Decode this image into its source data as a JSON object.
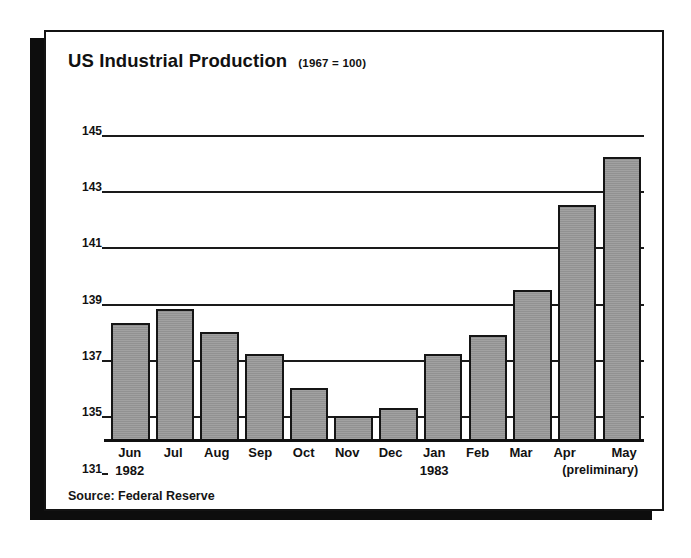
{
  "figure": {
    "title": "US Industrial Production",
    "subtitle": "(1967 = 100)",
    "source": "Source: Federal Reserve"
  },
  "chart_data": {
    "type": "bar",
    "title": "US Industrial Production",
    "subtitle": "(1967 = 100)",
    "xlabel": "",
    "ylabel": "",
    "ylim": [
      131,
      145
    ],
    "grid": true,
    "legend": "none",
    "source": "Source: Federal Reserve",
    "ytick_labels": [
      "145",
      "143",
      "141",
      "139",
      "137",
      "135",
      "131"
    ],
    "ytick_values": [
      145,
      143,
      141,
      139,
      137,
      135,
      131
    ],
    "axis_note": "baseline is broken/compressed between 135 and 131",
    "categories": [
      "Jun",
      "Jul",
      "Aug",
      "Sep",
      "Oct",
      "Nov",
      "Dec",
      "Jan",
      "Feb",
      "Mar",
      "Apr",
      "May"
    ],
    "category_years": [
      "1982",
      "",
      "",
      "",
      "",
      "",
      "",
      "1983",
      "",
      "",
      "",
      ""
    ],
    "category_notes": [
      "",
      "",
      "",
      "",
      "",
      "",
      "",
      "",
      "",
      "",
      "",
      "(preliminary)"
    ],
    "values": [
      138.3,
      138.8,
      138.0,
      137.2,
      136.0,
      135.0,
      135.3,
      137.2,
      137.9,
      139.5,
      142.5,
      144.2
    ]
  },
  "bars": [
    {
      "label": "Jun",
      "year": "1982",
      "note": "",
      "value": 138.3
    },
    {
      "label": "Jul",
      "year": "",
      "note": "",
      "value": 138.8
    },
    {
      "label": "Aug",
      "year": "",
      "note": "",
      "value": 138.0
    },
    {
      "label": "Sep",
      "year": "",
      "note": "",
      "value": 137.2
    },
    {
      "label": "Oct",
      "year": "",
      "note": "",
      "value": 136.0
    },
    {
      "label": "Nov",
      "year": "",
      "note": "",
      "value": 135.0
    },
    {
      "label": "Dec",
      "year": "",
      "note": "",
      "value": 135.3
    },
    {
      "label": "Jan",
      "year": "1983",
      "note": "",
      "value": 137.2
    },
    {
      "label": "Feb",
      "year": "",
      "note": "",
      "value": 137.9
    },
    {
      "label": "Mar",
      "year": "",
      "note": "",
      "value": 139.5
    },
    {
      "label": "Apr",
      "year": "",
      "note": "",
      "value": 142.5
    },
    {
      "label": "May",
      "year": "",
      "note": "(preliminary)",
      "value": 144.2
    }
  ],
  "colors": {
    "bar_fill": "#9c9c9c",
    "bar_outline": "#151515",
    "axis": "#101010",
    "text": "#111111",
    "card_bg": "#ffffff",
    "shadow": "#0d0d0d"
  }
}
